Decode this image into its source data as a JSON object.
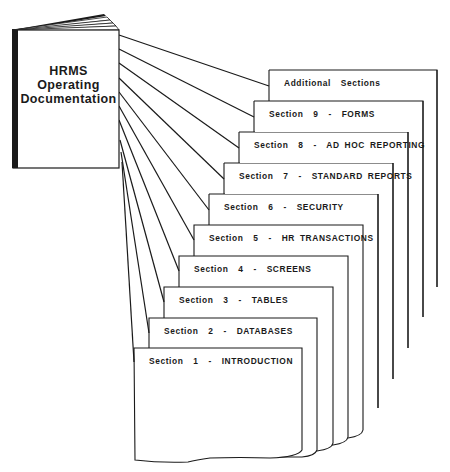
{
  "diagram": {
    "type": "documentation-structure",
    "colors": {
      "ink": "#1a1a1a",
      "paper": "#ffffff"
    },
    "book": {
      "title_lines": [
        "HRMS",
        "Operating",
        "Documentation"
      ]
    },
    "sections": [
      {
        "number": 1,
        "label": "Section  1  -  INTRODUCTION"
      },
      {
        "number": 2,
        "label": "Section  2  -  DATABASES"
      },
      {
        "number": 3,
        "label": "Section  3  -  TABLES"
      },
      {
        "number": 4,
        "label": "Section  4  -  SCREENS"
      },
      {
        "number": 5,
        "label": "Section  5  -  HR TRANSACTIONS"
      },
      {
        "number": 6,
        "label": "Section  6  -  SECURITY"
      },
      {
        "number": 7,
        "label": "Section  7  -  STANDARD REPORTS"
      },
      {
        "number": 8,
        "label": "Section  8  -  AD HOC REPORTING"
      },
      {
        "number": 9,
        "label": "Section  9  -  FORMS"
      },
      {
        "number": 10,
        "label": "Additional  Sections"
      }
    ]
  }
}
